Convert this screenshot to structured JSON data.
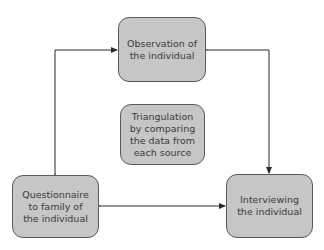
{
  "diagram": {
    "type": "cycle-diagram",
    "nodes": {
      "observation": {
        "label": "Observation of\nthe individual"
      },
      "triangulation": {
        "label": "Triangulation\nby comparing\nthe data from\neach source"
      },
      "questionnaire": {
        "label": "Questionnaire\nto family of\nthe individual"
      },
      "interviewing": {
        "label": "Interviewing\nthe individual"
      }
    },
    "edges": [
      {
        "from": "questionnaire",
        "to": "observation",
        "direction": "bidirectional"
      },
      {
        "from": "observation",
        "to": "interviewing",
        "direction": "bidirectional"
      },
      {
        "from": "questionnaire",
        "to": "interviewing",
        "direction": "bidirectional"
      }
    ],
    "colors": {
      "node_fill": "#c6c6c6",
      "node_border": "#5a5a5a",
      "text": "#3a3a3a",
      "edge": "#2a2a2a"
    }
  }
}
